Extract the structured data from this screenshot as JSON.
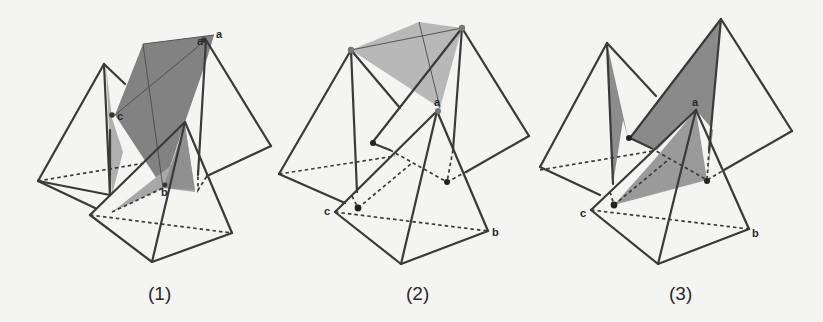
{
  "figure": {
    "panels": [
      {
        "caption": "(1)",
        "labels": {
          "a_top": "a",
          "a_overlap": "a",
          "c": "c",
          "b_stack": "b"
        }
      },
      {
        "caption": "(2)",
        "labels": {
          "a": "a",
          "b": "b",
          "c": "c"
        }
      },
      {
        "caption": "(3)",
        "labels": {
          "a": "a",
          "b": "b",
          "c": "c"
        }
      }
    ],
    "colors": {
      "edge": "#3a3a3a",
      "shade_dark": "#7d7d7d",
      "shade_light": "#b4b4b4",
      "background": "#f4f4f2"
    }
  }
}
